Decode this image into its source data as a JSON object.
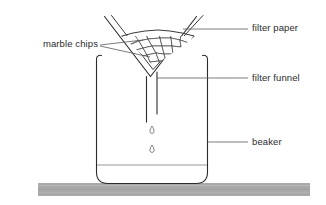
{
  "diagram": {
    "background_color": "#ffffff",
    "line_color": "#2b2b2b",
    "leader_color": "#5a5a5a",
    "text_color": "#2b2b2b",
    "bench_color": "#a8a8a8",
    "liquid_line_color": "#8c8c8c",
    "labels": [
      {
        "id": "marble-chips",
        "text": "marble chips",
        "side": "left",
        "x": 98,
        "y": 47
      },
      {
        "id": "filter-paper",
        "text": "filter paper",
        "side": "right",
        "x": 252,
        "y": 31
      },
      {
        "id": "filter-funnel",
        "text": "filter funnel",
        "side": "right",
        "x": 252,
        "y": 81
      },
      {
        "id": "beaker",
        "text": "beaker",
        "side": "right",
        "x": 252,
        "y": 145
      }
    ],
    "parts": {
      "funnel": "filter funnel",
      "paper": "filter paper",
      "beaker": "beaker",
      "chips": "marble chips",
      "bench": "bench surface",
      "droplet": "liquid droplet",
      "liquid_level": "filtrate level"
    },
    "droplet_count": 2
  }
}
